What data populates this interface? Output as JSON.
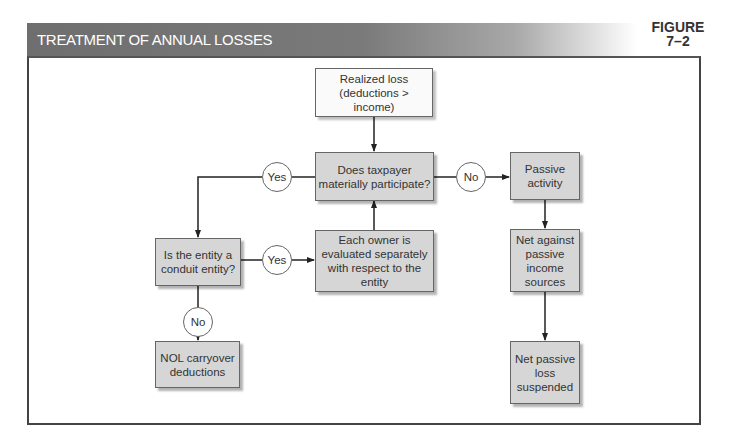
{
  "header": {
    "title": "TREATMENT OF ANNUAL LOSSES",
    "figure_label_line1": "FIGURE",
    "figure_label_line2": "7–2"
  },
  "nodes": {
    "realized_loss": "Realized loss (deductions > income)",
    "material_participation": "Does taxpayer materially participate?",
    "passive_activity": "Passive activity",
    "conduit_entity": "Is the entity a conduit entity?",
    "owner_evaluated": "Each owner is evaluated separately with respect to the entity",
    "net_against_passive": "Net against passive income sources",
    "nol_carryover": "NOL carryover deductions",
    "net_passive_loss": "Net passive loss suspended"
  },
  "decisions": {
    "participate_yes": "Yes",
    "participate_no": "No",
    "conduit_yes": "Yes",
    "conduit_no": "No"
  },
  "colors": {
    "header_bar": "#6e6e6e",
    "process_box": "#d6d6d6",
    "start_box": "#fafafa",
    "stroke": "#333333"
  }
}
